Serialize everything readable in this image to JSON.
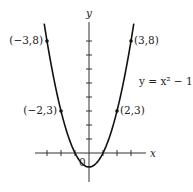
{
  "chart_data": {
    "type": "line",
    "title": "",
    "xlabel": "x",
    "ylabel": "y",
    "function": "y = x^2 - 1",
    "curve_label": "y = x² − 1",
    "origin_label": "0",
    "x_range": [
      -3.2,
      3.2
    ],
    "xlim": [
      -3.5,
      4
    ],
    "ylim": [
      -2,
      9
    ],
    "x_ticks": [
      -3,
      -2,
      -1,
      1,
      2,
      3
    ],
    "y_ticks": [
      1,
      2,
      3,
      4,
      5,
      6,
      7,
      8
    ],
    "grid": false,
    "points": [
      {
        "x": -3,
        "y": 8,
        "label": "(−3,8)"
      },
      {
        "x": -2,
        "y": 3,
        "label": "(−2,3)"
      },
      {
        "x": 2,
        "y": 3,
        "label": "(2,3)"
      },
      {
        "x": 3,
        "y": 8,
        "label": "(3,8)"
      }
    ],
    "series": [
      {
        "name": "y = x^2 - 1",
        "x": [
          -3.2,
          -3,
          -2.5,
          -2,
          -1.5,
          -1,
          -0.5,
          0,
          0.5,
          1,
          1.5,
          2,
          2.5,
          3,
          3.2
        ],
        "values": [
          9.24,
          8,
          5.25,
          3,
          1.25,
          0,
          -0.75,
          -1,
          -0.75,
          0,
          1.25,
          3,
          5.25,
          8,
          9.24
        ]
      }
    ]
  }
}
